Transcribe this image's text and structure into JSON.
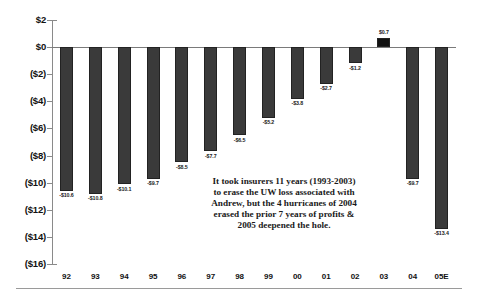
{
  "chart_data": {
    "type": "bar",
    "title": "",
    "subtitle": "",
    "xlabel": "",
    "ylabel": "",
    "categories": [
      "92",
      "93",
      "94",
      "95",
      "96",
      "97",
      "98",
      "99",
      "00",
      "01",
      "02",
      "03",
      "04",
      "05E"
    ],
    "values": [
      -10.6,
      -10.8,
      -10.1,
      -9.7,
      -8.5,
      -7.7,
      -6.5,
      -5.2,
      -3.8,
      -2.7,
      -1.2,
      0.7,
      -9.7,
      -13.4
    ],
    "data_labels": [
      "-$10.6",
      "-$10.8",
      "-$10.1",
      "-$9.7",
      "-$8.5",
      "-$7.7",
      "-$6.5",
      "-$5.2",
      "-$3.8",
      "-$2.7",
      "-$1.2",
      "$0.7",
      "-$9.7",
      "-$13.4"
    ],
    "ylim": [
      -16,
      2
    ],
    "ytick_values": [
      2,
      0,
      -2,
      -4,
      -6,
      -8,
      -10,
      -12,
      -14,
      -16
    ],
    "ytick_labels": [
      "$2",
      "$0",
      "($2)",
      "($4)",
      "($6)",
      "($8)",
      "($10)",
      "($12)",
      "($14)",
      "($16)"
    ],
    "grid": false,
    "legend": null,
    "bar_color": "#3a3a3a",
    "positive_bar_color": "#111111",
    "axis_color": "#8a8a8a",
    "annotations": [
      {
        "lines": [
          "It took insurers 11 years (1993-2003)",
          "to erase the UW loss associated with",
          "Andrew, but the 4 hurricanes of 2004",
          "erased the prior 7 years of profits &",
          "2005 deepened the hole."
        ]
      }
    ]
  }
}
